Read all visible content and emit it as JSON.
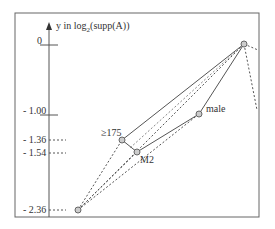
{
  "axis": {
    "label_prefix": "y in log",
    "label_sub": "2",
    "label_suffix": "(supp(A))",
    "ticks": [
      {
        "label": "0",
        "value": 0,
        "y": 45,
        "style": "solid"
      },
      {
        "label": "- 1.00",
        "value": -1.0,
        "y": 115,
        "style": "solid"
      },
      {
        "label": "- 1.36",
        "value": -1.36,
        "y": 140,
        "style": "dashed"
      },
      {
        "label": "- 1.54",
        "value": -1.54,
        "y": 153,
        "style": "dashed"
      },
      {
        "label": "- 2.36",
        "value": -2.36,
        "y": 210,
        "style": "dashed"
      }
    ]
  },
  "nodes": [
    {
      "id": "top",
      "label": "",
      "x": 244,
      "y": 44
    },
    {
      "id": "ge175",
      "label": "≥175",
      "x": 122,
      "y": 140
    },
    {
      "id": "m2",
      "label": "M2",
      "x": 137,
      "y": 152
    },
    {
      "id": "male",
      "label": "male",
      "x": 199,
      "y": 114
    },
    {
      "id": "bottom",
      "label": "",
      "x": 78,
      "y": 210
    }
  ],
  "colors": {
    "line": "#555555",
    "node_fill": "#cccccc",
    "border": "#666666"
  }
}
